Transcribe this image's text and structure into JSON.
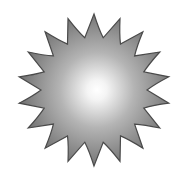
{
  "image": {
    "subject": "sun-starburst",
    "points": 18,
    "colors": {
      "background": "#ffffff",
      "center": "#ffffff",
      "mid": "#b8b8b8",
      "edge": "#6e6e6e",
      "outline": "#4a4a4a"
    }
  }
}
